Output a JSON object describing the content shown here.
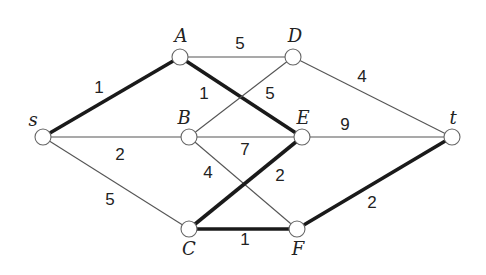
{
  "graph": {
    "nodes": [
      {
        "id": "s",
        "label": "s",
        "x": 43,
        "y": 137,
        "lx": 33,
        "ly": 126
      },
      {
        "id": "A",
        "label": "A",
        "x": 180,
        "y": 57,
        "lx": 181,
        "ly": 42
      },
      {
        "id": "D",
        "label": "D",
        "x": 293,
        "y": 57,
        "lx": 295,
        "ly": 42
      },
      {
        "id": "B",
        "label": "B",
        "x": 189,
        "y": 137,
        "lx": 184,
        "ly": 124
      },
      {
        "id": "E",
        "label": "E",
        "x": 302,
        "y": 137,
        "lx": 303,
        "ly": 124
      },
      {
        "id": "t",
        "label": "t",
        "x": 452,
        "y": 137,
        "lx": 453,
        "ly": 124
      },
      {
        "id": "C",
        "label": "C",
        "x": 189,
        "y": 229,
        "lx": 189,
        "ly": 255
      },
      {
        "id": "F",
        "label": "F",
        "x": 297,
        "y": 229,
        "lx": 298,
        "ly": 255
      }
    ],
    "edges": [
      {
        "from": "s",
        "to": "A",
        "weight": "1",
        "bold": true,
        "lx": 99,
        "ly": 93
      },
      {
        "from": "A",
        "to": "D",
        "weight": "5",
        "bold": false,
        "lx": 240,
        "ly": 49
      },
      {
        "from": "A",
        "to": "E",
        "weight": "1",
        "bold": true,
        "lx": 204,
        "ly": 99
      },
      {
        "from": "B",
        "to": "D",
        "weight": "5",
        "bold": false,
        "lx": 270,
        "ly": 99
      },
      {
        "from": "D",
        "to": "t",
        "weight": "4",
        "bold": false,
        "lx": 362,
        "ly": 82
      },
      {
        "from": "s",
        "to": "B",
        "weight": "2",
        "bold": false,
        "lx": 120,
        "ly": 160
      },
      {
        "from": "B",
        "to": "E",
        "weight": "7",
        "bold": false,
        "lx": 245,
        "ly": 155
      },
      {
        "from": "E",
        "to": "t",
        "weight": "9",
        "bold": false,
        "lx": 345,
        "ly": 130
      },
      {
        "from": "B",
        "to": "F",
        "weight": "4",
        "bold": false,
        "lx": 208,
        "ly": 178
      },
      {
        "from": "C",
        "to": "E",
        "weight": "2",
        "bold": true,
        "lx": 280,
        "ly": 181
      },
      {
        "from": "s",
        "to": "C",
        "weight": "5",
        "bold": false,
        "lx": 110,
        "ly": 205
      },
      {
        "from": "C",
        "to": "F",
        "weight": "1",
        "bold": true,
        "lx": 245,
        "ly": 245
      },
      {
        "from": "F",
        "to": "t",
        "weight": "2",
        "bold": true,
        "lx": 372,
        "ly": 208
      }
    ]
  }
}
